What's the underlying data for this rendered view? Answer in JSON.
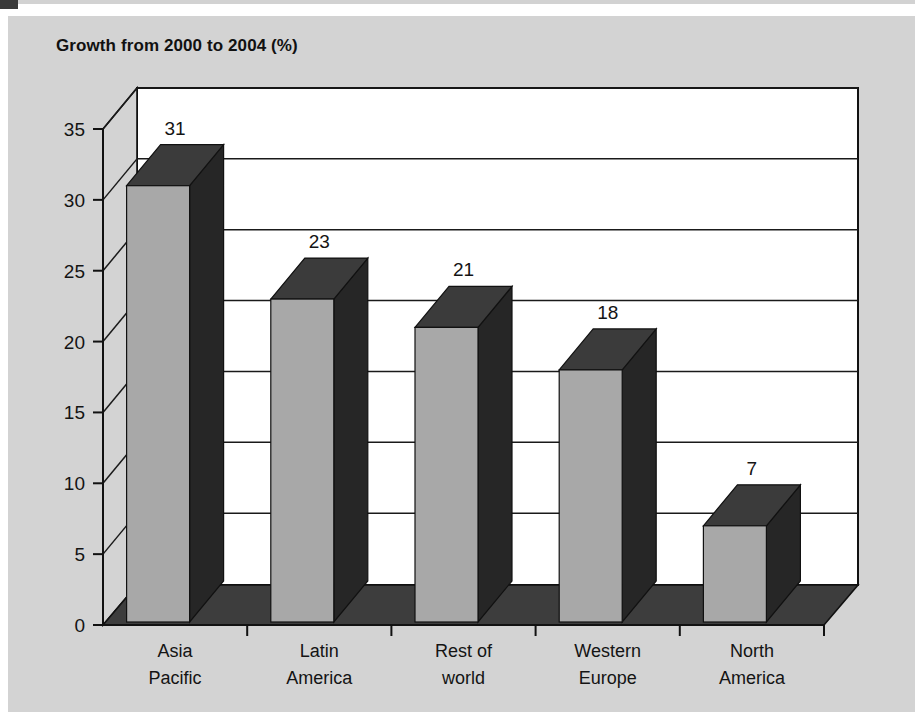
{
  "chart_data": {
    "type": "bar",
    "title": "Growth from 2000 to 2004 (%)",
    "subtitle": "",
    "xlabel": "",
    "ylabel": "",
    "categories": [
      "Asia Pacific",
      "Latin America",
      "Rest of world",
      "Western Europe",
      "North America"
    ],
    "category_lines": [
      [
        "Asia",
        "Pacific"
      ],
      [
        "Latin",
        "America"
      ],
      [
        "Rest of",
        "world"
      ],
      [
        "Western",
        "Europe"
      ],
      [
        "North",
        "America"
      ]
    ],
    "values": [
      31,
      23,
      21,
      18,
      7
    ],
    "value_labels": [
      "31",
      "23",
      "21",
      "18",
      "7"
    ],
    "ylim": [
      0,
      35
    ],
    "yticks": [
      0,
      5,
      10,
      15,
      20,
      25,
      30,
      35
    ],
    "ytick_labels": [
      "0",
      "5",
      "10",
      "15",
      "20",
      "25",
      "30",
      "35"
    ],
    "grid": true,
    "grid_axis": "y",
    "legend": false,
    "legend_position": "none",
    "style": "3d-column",
    "colors": {
      "panel_background": "#d3d3d3",
      "plot_background": "#ffffff",
      "bar_front": "#a8a8a8",
      "bar_top": "#3b3b3b",
      "bar_side": "#262626",
      "floor": "#3d3d3d",
      "wall_left": "#d3d3d3",
      "axis_line": "#111111",
      "grid_line": "#1a1a1a",
      "text": "#141414"
    }
  },
  "title": {
    "text": "Growth from 2000 to 2004 (%)"
  },
  "axis": {
    "y_ticks": [
      "35",
      "30",
      "25",
      "20",
      "15",
      "10",
      "5",
      "0"
    ]
  },
  "bars": [
    {
      "category_line1": "Asia",
      "category_line2": "Pacific",
      "value_label": "31"
    },
    {
      "category_line1": "Latin",
      "category_line2": "America",
      "value_label": "23"
    },
    {
      "category_line1": "Rest of",
      "category_line2": "world",
      "value_label": "21"
    },
    {
      "category_line1": "Western",
      "category_line2": "Europe",
      "value_label": "18"
    },
    {
      "category_line1": "North",
      "category_line2": "America",
      "value_label": "7"
    }
  ]
}
